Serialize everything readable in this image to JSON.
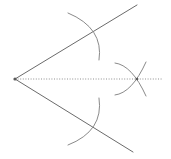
{
  "figure": {
    "title": "Angle bisection compass-and-straightedge construction",
    "canvas": {
      "width": 171,
      "height": 159,
      "background": "#ffffff"
    },
    "colors": {
      "ray": "#6b6b6b",
      "arc": "#8a8a8a",
      "bisector": "#8f8f8f",
      "vertex": "#5a5a5a",
      "background": "#ffffff"
    },
    "points": {
      "vertex": {
        "name": "angle-vertex",
        "x": 15,
        "y": 79
      },
      "upper_ray_end": {
        "name": "upper-ray-endpoint",
        "x": 137,
        "y": 5
      },
      "lower_ray_end": {
        "name": "lower-ray-endpoint",
        "x": 133,
        "y": 152
      },
      "upper_arc_crossing": {
        "name": "upper-arc-ray-intersection",
        "x": 90,
        "y": 34
      },
      "lower_arc_crossing": {
        "name": "lower-arc-ray-intersection",
        "x": 90,
        "y": 124
      },
      "bisector_crossing": {
        "name": "bisector-arc-intersection",
        "x": 137,
        "y": 79
      },
      "bisector_end": {
        "name": "bisector-endpoint",
        "x": 163,
        "y": 79
      }
    },
    "rays": [
      {
        "name": "upper-ray",
        "label": "upper side of angle",
        "path": "M 15 79 L 137 5"
      },
      {
        "name": "lower-ray",
        "label": "lower side of angle",
        "path": "M 15 79 L 133 152"
      }
    ],
    "arcs": [
      {
        "name": "upper-construction-arc",
        "label": "arc centred on vertex crossing the upper ray",
        "path": "M 68 13 Q 104 28 99 60"
      },
      {
        "name": "lower-construction-arc",
        "label": "arc centred on vertex crossing the lower ray",
        "path": "M 99 98 Q 104 131 68 145"
      },
      {
        "name": "upper-left-bisector-arc",
        "label": "arc from the upper ray intersection",
        "path": "M 115 63 Q 132 65 146 96"
      },
      {
        "name": "lower-left-bisector-arc",
        "label": "arc from the lower ray intersection",
        "path": "M 115 95 Q 132 93 146 62"
      }
    ],
    "bisector": {
      "name": "angle-bisector",
      "label": "dotted bisector ray",
      "style": "dotted",
      "path": "M 15 79 L 163 79"
    }
  }
}
